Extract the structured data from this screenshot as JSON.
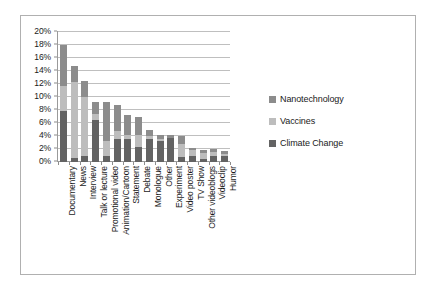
{
  "chart_data": {
    "type": "bar",
    "subtype": "stacked-column",
    "title": "",
    "xlabel": "",
    "ylabel": "",
    "ylim": [
      0,
      20
    ],
    "ytick_labels": [
      "20%",
      "18%",
      "16%",
      "14%",
      "12%",
      "10%",
      "8%",
      "6%",
      "4%",
      "2%",
      "0%"
    ],
    "ytick_values": [
      20,
      18,
      16,
      14,
      12,
      10,
      8,
      6,
      4,
      2,
      0
    ],
    "grid": true,
    "legend_position": "right",
    "categories": [
      "Documentary",
      "News",
      "Interview",
      "Talk or lecture",
      "Promotional video",
      "Animation/Cartoon",
      "Statement",
      "Debate",
      "Monologue",
      "Other",
      "Experiment",
      "Video poster",
      "TV Show",
      "Other videoblogs",
      "Videoclip",
      "Humor"
    ],
    "series": [
      {
        "name": "Climate Change",
        "color": "#636363",
        "values": [
          7.8,
          0.6,
          1.0,
          6.4,
          1.0,
          3.6,
          3.5,
          2.3,
          3.5,
          3.2,
          3.7,
          0.7,
          1.0,
          0.4,
          1.0,
          1.0
        ]
      },
      {
        "name": "Vaccines",
        "color": "#bdbdbd",
        "values": [
          3.9,
          11.7,
          9.0,
          1.0,
          2.3,
          1.1,
          0.6,
          1.9,
          0.5,
          0.4,
          0.0,
          2.1,
          0.8,
          1.0,
          0.6,
          0.3
        ]
      },
      {
        "name": "Nanotechnology",
        "color": "#8c8c8c",
        "values": [
          6.3,
          2.4,
          2.5,
          1.8,
          5.9,
          4.0,
          3.2,
          2.8,
          1.0,
          0.5,
          0.5,
          1.2,
          0.4,
          0.4,
          0.4,
          0.4
        ]
      }
    ],
    "totals": [
      18.0,
      14.7,
      12.5,
      9.2,
      9.2,
      8.7,
      7.3,
      7.0,
      5.0,
      4.1,
      4.2,
      4.0,
      2.2,
      1.8,
      2.0,
      1.7
    ]
  },
  "legend": {
    "items": [
      {
        "label": "Nanotechnology",
        "color": "#8c8c8c"
      },
      {
        "label": "Vaccines",
        "color": "#bdbdbd"
      },
      {
        "label": "Climate Change",
        "color": "#636363"
      }
    ]
  }
}
